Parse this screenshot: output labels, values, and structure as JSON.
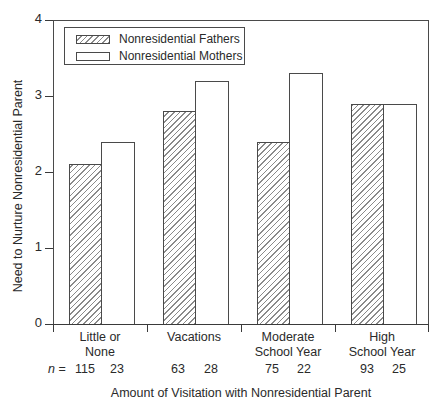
{
  "chart_data": {
    "type": "bar",
    "title": "",
    "xlabel": "Amount of Visitation with Nonresidential Parent",
    "ylabel": "Need to Nurture Nonresidential Parent",
    "ylim": [
      0,
      4
    ],
    "yticks": [
      "0",
      "1",
      "2",
      "3",
      "4"
    ],
    "grid": false,
    "legend_position": "upper left (inside)",
    "categories": [
      "Little or None",
      "Vacations",
      "Moderate School Year",
      "High School Year"
    ],
    "category_lines": [
      [
        "Little or",
        "None"
      ],
      [
        "Vacations"
      ],
      [
        "Moderate",
        "School Year"
      ],
      [
        "High",
        "School Year"
      ]
    ],
    "series": [
      {
        "name": "Nonresidential Fathers",
        "pattern": "hatched",
        "values": [
          2.1,
          2.8,
          2.4,
          2.9
        ],
        "n": [
          "115",
          "63",
          "75",
          "93"
        ]
      },
      {
        "name": "Nonresidential Mothers",
        "pattern": "open",
        "values": [
          2.4,
          3.2,
          3.3,
          2.9
        ],
        "n": [
          "23",
          "28",
          "22",
          "25"
        ]
      }
    ],
    "n_prefix": "n =",
    "annotations": [
      "Sample sizes (n) shown beneath each bar"
    ]
  },
  "legend": {
    "fathers": "Nonresidential Fathers",
    "mothers": "Nonresidential Mothers"
  },
  "axes": {
    "y_title": "Need to Nurture Nonresidential Parent",
    "x_title": "Amount of Visitation with Nonresidential Parent",
    "y_ticks": [
      "0",
      "1",
      "2",
      "3",
      "4"
    ],
    "categories": [
      {
        "line1": "Little or",
        "line2": "None"
      },
      {
        "line1": "Vacations",
        "line2": ""
      },
      {
        "line1": "Moderate",
        "line2": "School Year"
      },
      {
        "line1": "High",
        "line2": "School Year"
      }
    ]
  },
  "sample_sizes": {
    "prefix_letter": "n",
    "prefix_eq": " = ",
    "values": [
      "115",
      "23",
      "63",
      "28",
      "75",
      "22",
      "93",
      "25"
    ]
  },
  "colors": {
    "axis": "#3a3a3a",
    "text": "#2a2a2a",
    "hatch": "#8a8a8a",
    "background": "#ffffff"
  }
}
